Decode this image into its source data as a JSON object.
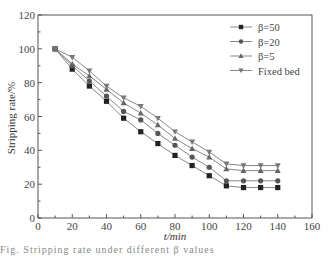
{
  "chart_data": {
    "type": "line",
    "title": "",
    "xlabel": "t/min",
    "ylabel": "Stripping rate/%",
    "xlim": [
      0,
      160
    ],
    "ylim": [
      0,
      120
    ],
    "xticks": [
      0,
      20,
      40,
      60,
      80,
      100,
      120,
      140,
      160
    ],
    "yticks": [
      0,
      20,
      40,
      60,
      80,
      100,
      120
    ],
    "grid": false,
    "legend_position": "upper right",
    "x": [
      10,
      20,
      30,
      40,
      50,
      60,
      70,
      80,
      90,
      100,
      110,
      120,
      130,
      140
    ],
    "series": [
      {
        "name": "β=50",
        "marker": "square",
        "color": "#222222",
        "values": [
          100,
          88,
          78,
          69,
          59,
          51,
          44,
          37,
          31,
          25,
          19,
          18,
          18,
          18
        ]
      },
      {
        "name": "β=20",
        "marker": "circle",
        "color": "#555555",
        "values": [
          100,
          90,
          81,
          72,
          63,
          58,
          50,
          43,
          36,
          30,
          22,
          22,
          22,
          22
        ]
      },
      {
        "name": "β=5",
        "marker": "triangle-up",
        "color": "#666666",
        "values": [
          100,
          91,
          84,
          76,
          68,
          62,
          55,
          47,
          41,
          36,
          29,
          28,
          28,
          28
        ]
      },
      {
        "name": "Fixed bed",
        "marker": "triangle-down",
        "color": "#777777",
        "values": [
          100,
          95,
          87,
          78,
          71,
          66,
          59,
          51,
          45,
          39,
          32,
          31,
          31,
          31
        ]
      }
    ]
  },
  "caption_fragment": "Fig. Stripping rate under different β values"
}
